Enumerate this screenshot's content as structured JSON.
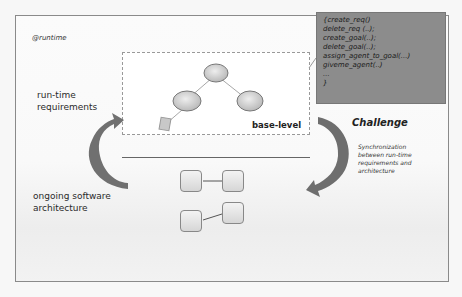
{
  "diagram": {
    "tag": "@runtime",
    "base_level_label": "base-level",
    "left_labels": {
      "runtime_requirements": [
        "run-time",
        "requirements"
      ],
      "ongoing_architecture": [
        "ongoing software",
        "architecture"
      ]
    },
    "code_panel": {
      "lines": [
        "{create_req()",
        " delete_req (..);",
        "create_goal(..);",
        "delete_goal(..);",
        "assign_agent_to_goal(...)",
        "giveme_agent(..)",
        "...",
        "}"
      ]
    },
    "challenge": {
      "title": "Challenge",
      "description": [
        "Synchronization",
        "between  run-time",
        "requirements and",
        "architecture"
      ]
    },
    "colors": {
      "code_panel_bg": "#8c8c8c",
      "arrow": "#6e6e6e",
      "ellipse_fill": "#cfcfcf",
      "frame_border": "#8a8a8a"
    },
    "tree": {
      "nodes": [
        "root-ellipse",
        "left-ellipse",
        "right-ellipse",
        "leaf-rect"
      ]
    },
    "architecture": {
      "components": 4,
      "connections": 2
    }
  }
}
